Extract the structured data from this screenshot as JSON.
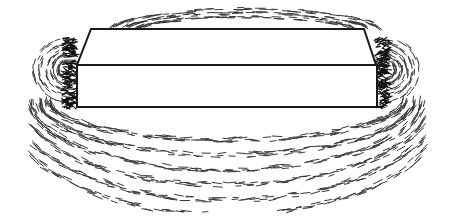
{
  "figure": {
    "colors": {
      "background": "#ffffff",
      "outline": "#1a1a1a",
      "filings": "#3a3a3a",
      "pole_cluster": "#111111"
    },
    "magnet": {
      "top_back": [
        [
          91,
          29
        ],
        [
          364,
          29
        ]
      ],
      "top_front": [
        [
          77,
          65
        ],
        [
          376,
          65
        ]
      ],
      "front_bottom": [
        [
          77,
          107
        ],
        [
          377,
          107
        ]
      ]
    }
  }
}
